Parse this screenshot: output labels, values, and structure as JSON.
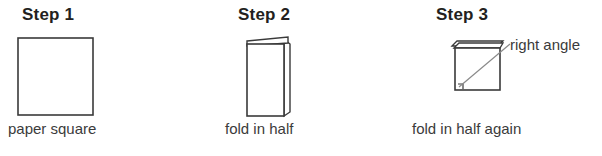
{
  "figure": {
    "line_color": "#3a3a3a",
    "text_color": "#231f20",
    "background": "#ffffff",
    "steps": [
      {
        "heading": "Step 1",
        "caption": "paper square",
        "shape": "square",
        "shape_name": "paper-square-outline"
      },
      {
        "heading": "Step 2",
        "caption": "fold in half",
        "shape": "folded-rectangle",
        "shape_name": "folded-paper-half"
      },
      {
        "heading": "Step 3",
        "caption": "fold in half again",
        "shape": "folded-square",
        "shape_name": "folded-paper-quarter",
        "annotation": "right angle",
        "annotation_marker": "right-angle-square"
      }
    ]
  }
}
